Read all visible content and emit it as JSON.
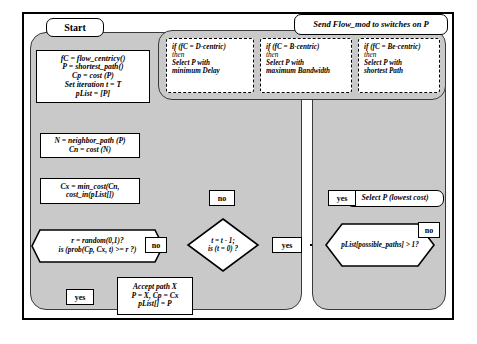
{
  "diagram": {
    "start": {
      "label": "Start"
    },
    "top_banner": {
      "label": "Send Flow_mod to switches on P"
    },
    "init_box": {
      "lines": "fC = flow_centricy()\nP = shortest_path()\nCp = cost (P)\nSet iteration t = T\npList = [P]"
    },
    "policy_boxes": [
      {
        "line1": "if (fC = D-centric)",
        "line2": "then",
        "line3": "Select P with",
        "line4": "minimum Delay"
      },
      {
        "line1": "if (fC = B-centric)",
        "line2": "then",
        "line3": "Select P with",
        "line4": "maximum Bandwidth"
      },
      {
        "line1": "if (fC = Be-centric)",
        "line2": "then",
        "line3": "Select P with",
        "line4": "shortest Path"
      }
    ],
    "neighbor_box": {
      "lines": "N = neighbor_path (P)\nCn = cost (N)"
    },
    "cost_box": {
      "lines": "Cx = min_cost(Cn,\ncost_in(pList[])"
    },
    "random_decision": {
      "line1": "r = random(0,1)?",
      "line2": "is (prob(Cp, Cx, t) >= r ?)"
    },
    "accept_box": {
      "lines": "Accept path X\nP = X, Cp = Cx\npList[] = P"
    },
    "iteration_decision": {
      "line1": "t = t - 1;",
      "line2": "is (t = 0) ?"
    },
    "paths_decision": {
      "line1": "pList[possible_paths] > 1?"
    },
    "select_box": {
      "label": "Select P (lowest cost)"
    },
    "labels": {
      "no_random": "no",
      "yes_random": "yes",
      "no_iteration": "no",
      "yes_iteration": "yes",
      "yes_paths": "yes",
      "no_paths": "no"
    },
    "colors": {
      "panel_fill": "#c9c9c9",
      "box_fill": "#ffffff",
      "stroke": "#000000"
    }
  }
}
